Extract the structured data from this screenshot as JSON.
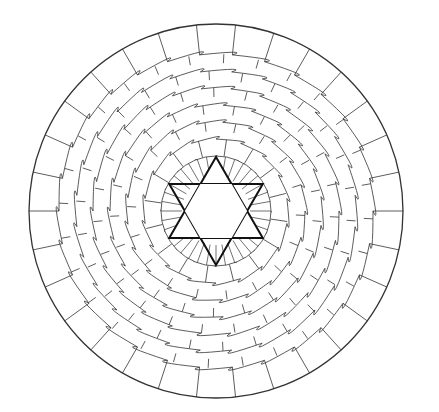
{
  "artwork": {
    "type": "mandala-coloring-page",
    "center": [
      216,
      211
    ],
    "outer_radius": 187,
    "inner_radius": 55,
    "star_radius": 54,
    "line_color": "#333333",
    "star_color": "#111111",
    "background": "#ffffff",
    "outer_ring_segments": 30,
    "petal_rings": 6
  }
}
